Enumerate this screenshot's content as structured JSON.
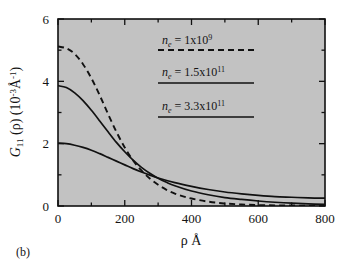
{
  "figure": {
    "panel_label": "(b)",
    "background_color": "#ffffff",
    "plot_background_color": "#c2c2c2",
    "frame_color": "#111111",
    "curve_color": "#111111"
  },
  "chart_data": {
    "type": "line",
    "title": "",
    "subtitle": "",
    "xlabel": "ρ Å",
    "ylabel": "G11 (ρ) (10-3Å-1)",
    "ylabel_parts": {
      "symbol": "G",
      "subscript": "11",
      "arg": " (ρ) (10",
      "exp1": "-3",
      "unit": "Å",
      "exp2": "-1",
      "close": ")"
    },
    "xlim": [
      0,
      800
    ],
    "ylim": [
      0,
      6
    ],
    "xticks": [
      0,
      200,
      400,
      600,
      800
    ],
    "yticks": [
      0,
      2,
      4,
      6
    ],
    "xtick_labels": [
      "0",
      "200",
      "400",
      "600",
      "800"
    ],
    "ytick_labels": [
      "0",
      "2",
      "4",
      "6"
    ],
    "x_minor_ticks": [
      100,
      300,
      500,
      700
    ],
    "y_minor_ticks": [
      1,
      3,
      5
    ],
    "grid": false,
    "legend_position": "upper-right-inside",
    "series": [
      {
        "name": "n_e = 1x10^9",
        "label_prefix": "n",
        "label_sub": "e",
        "label_mid": " = 1x10",
        "label_exp": "9",
        "style": "dashed",
        "color": "#111111",
        "x": [
          0,
          25,
          50,
          75,
          100,
          125,
          150,
          175,
          200,
          225,
          250,
          275,
          300,
          325,
          350,
          375,
          400,
          450,
          500,
          550,
          600,
          650,
          700,
          750,
          800
        ],
        "y": [
          5.12,
          5.06,
          4.88,
          4.55,
          4.1,
          3.55,
          2.95,
          2.38,
          1.88,
          1.46,
          1.14,
          0.88,
          0.68,
          0.52,
          0.4,
          0.31,
          0.24,
          0.14,
          0.08,
          0.05,
          0.03,
          0.02,
          0.015,
          0.01,
          0.01
        ]
      },
      {
        "name": "n_e = 1.5x10^11",
        "label_prefix": "n",
        "label_sub": "e",
        "label_mid": " = 1.5x10",
        "label_exp": "11",
        "style": "solid",
        "color": "#111111",
        "x": [
          0,
          25,
          50,
          75,
          100,
          125,
          150,
          175,
          200,
          225,
          250,
          275,
          300,
          325,
          350,
          400,
          450,
          500,
          550,
          600,
          650,
          700,
          750,
          800
        ],
        "y": [
          3.86,
          3.8,
          3.63,
          3.38,
          3.07,
          2.73,
          2.38,
          2.04,
          1.74,
          1.47,
          1.24,
          1.05,
          0.89,
          0.76,
          0.65,
          0.48,
          0.36,
          0.27,
          0.21,
          0.16,
          0.12,
          0.09,
          0.07,
          0.05
        ]
      },
      {
        "name": "n_e = 3.3x10^11",
        "label_prefix": "n",
        "label_sub": "e",
        "label_mid": " = 3.3x10",
        "label_exp": "11",
        "style": "solid",
        "color": "#111111",
        "x": [
          0,
          25,
          50,
          75,
          100,
          125,
          150,
          175,
          200,
          225,
          250,
          275,
          300,
          350,
          400,
          450,
          500,
          550,
          600,
          650,
          700,
          750,
          800
        ],
        "y": [
          2.02,
          2.0,
          1.95,
          1.88,
          1.79,
          1.68,
          1.56,
          1.44,
          1.32,
          1.2,
          1.09,
          0.99,
          0.9,
          0.75,
          0.63,
          0.53,
          0.45,
          0.39,
          0.34,
          0.3,
          0.28,
          0.26,
          0.25
        ]
      }
    ],
    "legend_entries": [
      {
        "style": "dashed",
        "prefix": "n",
        "sub": "e",
        "mid": " = 1x10",
        "exp": "9"
      },
      {
        "style": "solid",
        "prefix": "n",
        "sub": "e",
        "mid": " = 1.5x10",
        "exp": "11"
      },
      {
        "style": "solid",
        "prefix": "n",
        "sub": "e",
        "mid": " = 3.3x10",
        "exp": "11"
      }
    ]
  }
}
